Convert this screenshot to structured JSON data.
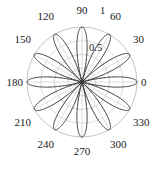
{
  "chart_data": {
    "type": "line",
    "subtype": "polar-rose",
    "title": "",
    "xlabel": "",
    "ylabel": "",
    "coordinate_system": "polar",
    "angle_unit": "degrees",
    "angular_tick_labels": [
      "0",
      "30",
      "60",
      "90",
      "120",
      "150",
      "180",
      "210",
      "240",
      "270",
      "300",
      "330"
    ],
    "angular_ticks": [
      0,
      30,
      60,
      90,
      120,
      150,
      180,
      210,
      240,
      270,
      300,
      330
    ],
    "radial_tick_labels": [
      "0.5",
      "1"
    ],
    "radial_ticks": [
      0.5,
      1
    ],
    "rlim": [
      0,
      1
    ],
    "grid": true,
    "legend": null,
    "petal_count": 12,
    "petal_peak_angles": [
      15,
      45,
      75,
      105,
      135,
      165,
      195,
      225,
      255,
      285,
      315,
      345
    ],
    "peak_radius": 1.0,
    "series": [
      {
        "name": "r = |cos(6*theta)|",
        "theta": [
          0,
          5,
          10,
          15,
          20,
          25,
          30,
          35,
          40,
          45,
          50,
          55,
          60,
          65,
          70,
          75,
          80,
          85,
          90,
          95,
          100,
          105,
          110,
          115,
          120,
          125,
          130,
          135,
          140,
          145,
          150,
          155,
          160,
          165,
          170,
          175,
          180,
          185,
          190,
          195,
          200,
          205,
          210,
          215,
          220,
          225,
          230,
          235,
          240,
          245,
          250,
          255,
          260,
          265,
          270,
          275,
          280,
          285,
          290,
          295,
          300,
          305,
          310,
          315,
          320,
          325,
          330,
          335,
          340,
          345,
          350,
          355
        ],
        "r": [
          0.0,
          0.5,
          0.866,
          1.0,
          0.866,
          0.5,
          0.0,
          0.5,
          0.866,
          1.0,
          0.866,
          0.5,
          0.0,
          0.5,
          0.866,
          1.0,
          0.866,
          0.5,
          0.0,
          0.5,
          0.866,
          1.0,
          0.866,
          0.5,
          0.0,
          0.5,
          0.866,
          1.0,
          0.866,
          0.5,
          0.0,
          0.5,
          0.866,
          1.0,
          0.866,
          0.5,
          0.0,
          0.5,
          0.866,
          1.0,
          0.866,
          0.5,
          0.0,
          0.5,
          0.866,
          1.0,
          0.866,
          0.5,
          0.0,
          0.5,
          0.866,
          1.0,
          0.866,
          0.5,
          0.0,
          0.5,
          0.866,
          1.0,
          0.866,
          0.5,
          0.0,
          0.5,
          0.866,
          1.0,
          0.866,
          0.5,
          0.0,
          0.5,
          0.866,
          1.0,
          0.866,
          0.5
        ]
      }
    ],
    "colors": {
      "data_line": "#3a3a3a",
      "grid": "#c8c8c8",
      "outer_circle": "#c0c0c0",
      "label_text": "#1a1a1a",
      "background": "#ffffff"
    }
  },
  "labels": {
    "a0": "0",
    "a30": "30",
    "a60": "60",
    "a90": "90",
    "a120": "120",
    "a150": "150",
    "a180": "180",
    "a210": "210",
    "a240": "240",
    "a270": "270",
    "a300": "300",
    "a330": "330",
    "r_half": "0.5",
    "r_one": "1"
  }
}
